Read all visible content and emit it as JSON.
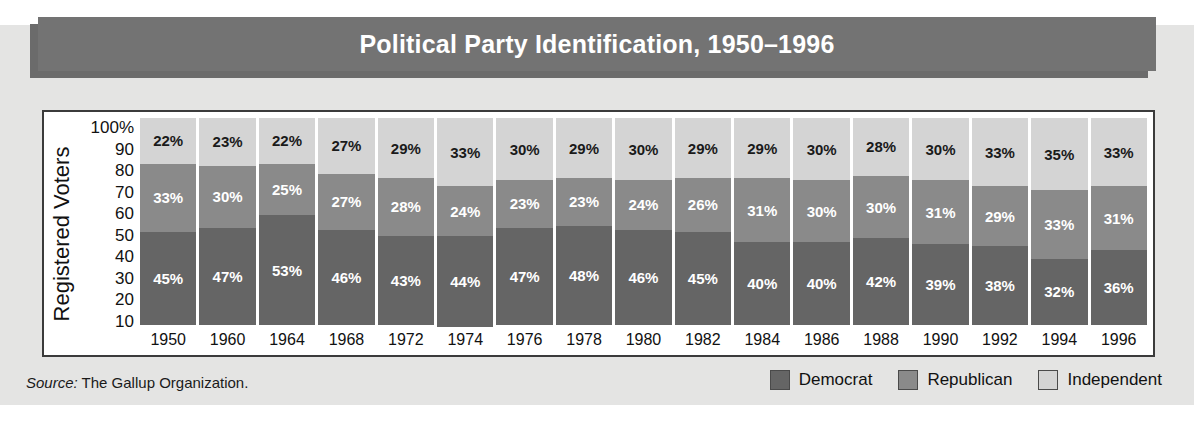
{
  "header": {
    "title": "Political Party Identification, 1950–1996"
  },
  "panel": {
    "y_axis_title": "Registered Voters",
    "y_ticks": [
      "100%",
      "90",
      "80",
      "70",
      "60",
      "50",
      "40",
      "30",
      "20",
      "10"
    ]
  },
  "footer": {
    "source_lead": "Source:",
    "source_text": " The Gallup Organization."
  },
  "legend": {
    "items": [
      {
        "label": "Democrat",
        "color": "#656565"
      },
      {
        "label": "Republican",
        "color": "#8a8a8a"
      },
      {
        "label": "Independent",
        "color": "#d4d4d4"
      }
    ]
  },
  "colors": {
    "democrat": "#656565",
    "republican": "#8a8a8a",
    "independent": "#d4d4d4",
    "title_bar": "#737373",
    "page_background": "#e4e4e3",
    "panel_background": "#ffffff",
    "panel_border": "#3b3b3b"
  },
  "chart_data": {
    "type": "bar",
    "subtype": "stacked-100-percent",
    "title": "Political Party Identification, 1950–1996",
    "xlabel": "",
    "ylabel": "Registered Voters",
    "ylim": [
      0,
      100
    ],
    "y_ticks": [
      10,
      20,
      30,
      40,
      50,
      60,
      70,
      80,
      90,
      100
    ],
    "grid": false,
    "legend_position": "bottom-right",
    "source": "The Gallup Organization.",
    "categories": [
      "1950",
      "1960",
      "1964",
      "1968",
      "1972",
      "1974",
      "1976",
      "1978",
      "1980",
      "1982",
      "1984",
      "1986",
      "1988",
      "1990",
      "1992",
      "1994",
      "1996"
    ],
    "series": [
      {
        "name": "Democrat",
        "color": "#656565",
        "values": [
          45,
          47,
          53,
          46,
          43,
          44,
          47,
          48,
          46,
          45,
          40,
          40,
          42,
          39,
          38,
          32,
          36
        ],
        "labels": [
          "45%",
          "47%",
          "53%",
          "46%",
          "43%",
          "44%",
          "47%",
          "48%",
          "46%",
          "45%",
          "40%",
          "40%",
          "42%",
          "39%",
          "38%",
          "32%",
          "36%"
        ]
      },
      {
        "name": "Republican",
        "color": "#8a8a8a",
        "values": [
          33,
          30,
          25,
          27,
          28,
          24,
          23,
          23,
          24,
          26,
          31,
          30,
          30,
          31,
          29,
          33,
          31
        ],
        "labels": [
          "33%",
          "30%",
          "25%",
          "27%",
          "28%",
          "24%",
          "23%",
          "23%",
          "24%",
          "26%",
          "31%",
          "30%",
          "30%",
          "31%",
          "29%",
          "33%",
          "31%"
        ]
      },
      {
        "name": "Independent",
        "color": "#d4d4d4",
        "values": [
          22,
          23,
          22,
          27,
          29,
          33,
          30,
          29,
          30,
          29,
          29,
          30,
          28,
          30,
          33,
          35,
          33
        ],
        "labels": [
          "22%",
          "23%",
          "22%",
          "27%",
          "29%",
          "33%",
          "30%",
          "29%",
          "30%",
          "29%",
          "29%",
          "30%",
          "28%",
          "30%",
          "33%",
          "35%",
          "33%"
        ]
      }
    ]
  }
}
